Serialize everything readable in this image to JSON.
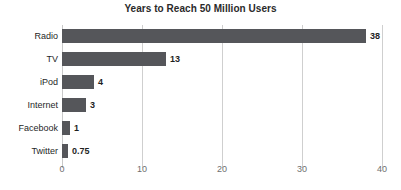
{
  "chart_data": {
    "type": "bar",
    "orientation": "horizontal",
    "title": "Years to Reach 50 Million Users",
    "xlabel": "",
    "ylabel": "",
    "categories": [
      "Radio",
      "TV",
      "iPod",
      "Internet",
      "Facebook",
      "Twitter"
    ],
    "values": [
      38,
      13,
      4,
      3,
      1,
      0.75
    ],
    "value_labels": [
      "38",
      "13",
      "4",
      "3",
      "1",
      "0.75"
    ],
    "xlim": [
      0,
      40
    ],
    "xticks": [
      0,
      10,
      20,
      30,
      40
    ],
    "xtick_labels": [
      "0",
      "10",
      "20",
      "30",
      "40"
    ],
    "grid": "vertical",
    "legend": "none",
    "series": [
      {
        "name": "Years to reach 50 million users",
        "values": [
          38,
          13,
          4,
          3,
          1,
          0.75
        ]
      }
    ],
    "colors": {
      "bar": "#55565a",
      "gridline": "#cfcfcf",
      "background": "#ffffff",
      "title_text": "#2a2a2a",
      "category_text": "#1f1f1f",
      "value_text": "#1f1f1f",
      "tick_text": "#6e6e6e"
    }
  }
}
